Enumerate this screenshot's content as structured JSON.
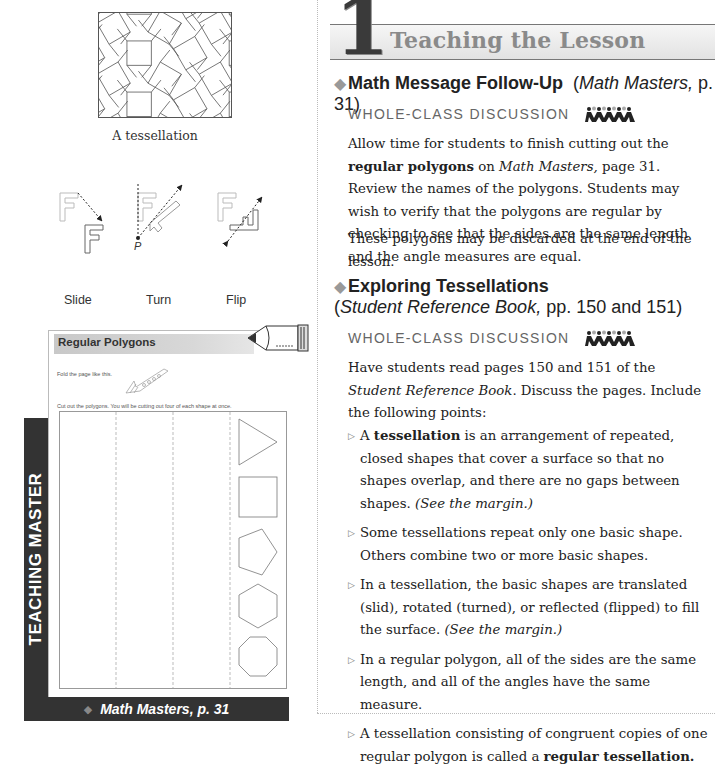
{
  "margin": {
    "tessellation_caption": "A tessellation",
    "transform_labels": [
      "Slide",
      "Turn",
      "Flip"
    ],
    "turn_point_label": "P",
    "teaching_master": {
      "side_label": "TEACHING MASTER",
      "title": "Regular Polygons",
      "fold_instruction": "Fold the page like this.",
      "cut_instruction": "Cut out the polygons. You will be cutting out four of each shape at once.",
      "shapes": [
        "triangle",
        "square",
        "pentagon",
        "hexagon",
        "octagon"
      ],
      "footer": "Math Masters, p. 31"
    }
  },
  "header": {
    "number": "1",
    "title": "Teaching the Lesson"
  },
  "sections": [
    {
      "title": "Math Message Follow-Up",
      "ref_open": "(",
      "ref_italic": "Math Masters,",
      "ref_rest": " p. 31)",
      "activity": "WHOLE-CLASS DISCUSSION",
      "paragraphs": [
        {
          "p1": "Allow time for students to finish cutting out the ",
          "b1": "regular polygons",
          "p2": " on ",
          "i1": "Math Masters,",
          "p3": " page 31. Review the names of the polygons. Students may wish to verify that the polygons are regular by checking to see that the sides are the same length and the angle measures are equal."
        },
        {
          "text": "These polygons may be discarded at the end of the lesson."
        }
      ]
    },
    {
      "title": "Exploring Tessellations",
      "ref_open": "(",
      "ref_italic": "Student Reference Book,",
      "ref_rest": " pp. 150 and 151)",
      "activity": "WHOLE-CLASS DISCUSSION",
      "intro": {
        "p1": "Have students read pages 150 and 151 of the ",
        "i1": "Student Reference Book",
        "p2": ". Discuss the pages. Include the following points:"
      },
      "bullets": [
        {
          "a": "A ",
          "b": "tessellation",
          "c": " is an arrangement of repeated, closed shapes that cover a surface so that no shapes overlap, and there are no gaps between shapes. ",
          "i": "(See the margin.)"
        },
        {
          "a": "Some tessellations repeat only one basic shape. Others combine two or more basic shapes.",
          "b": "",
          "c": "",
          "i": ""
        },
        {
          "a": "In a tessellation, the basic shapes are translated (slid), rotated (turned), or reflected (flipped) to fill the surface. ",
          "b": "",
          "c": "",
          "i": "(See the margin.)"
        },
        {
          "a": "In a regular polygon, all of the sides are the same length, and all of the angles have the same measure.",
          "b": "",
          "c": "",
          "i": ""
        },
        {
          "a": "A tessellation consisting of congruent copies of one regular polygon is called a ",
          "b": "regular tessellation.",
          "c": "",
          "i": ""
        }
      ]
    }
  ]
}
